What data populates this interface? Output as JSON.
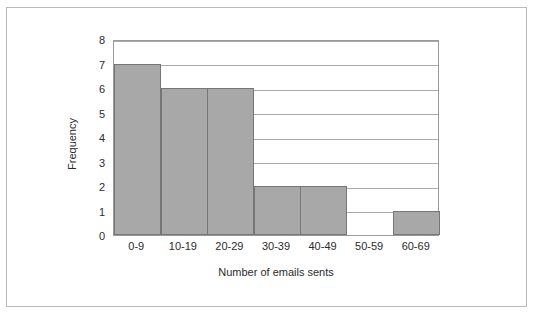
{
  "figure": {
    "clipped_header_fragments": [
      "",
      ""
    ]
  },
  "chart_data": {
    "type": "bar",
    "title": "",
    "subtitle": "",
    "xlabel": "Number of emails sents",
    "ylabel": "Frequency",
    "categories": [
      "0-9",
      "10-19",
      "20-29",
      "30-39",
      "40-49",
      "50-59",
      "60-69"
    ],
    "values": [
      7,
      6,
      6,
      2,
      2,
      0,
      1
    ],
    "series": [
      {
        "name": "Frequency",
        "values": [
          7,
          6,
          6,
          2,
          2,
          0,
          1
        ]
      }
    ],
    "ylim": [
      0,
      8
    ],
    "ytick_labels": [
      "0",
      "1",
      "2",
      "3",
      "4",
      "5",
      "6",
      "7",
      "8"
    ],
    "ytick_values": [
      0,
      1,
      2,
      3,
      4,
      5,
      6,
      7,
      8
    ],
    "grid": "horizontal",
    "legend": "none",
    "bar_fill_color": "#a8a8a8",
    "bar_border_color": "#767676",
    "gridline_color": "#a9a9a9",
    "axis_color": "#9a9a9a",
    "text_color": "#2b2b2b",
    "background_color": "#ffffff",
    "frame_border_color": "#b9b9b9",
    "annotations": []
  }
}
